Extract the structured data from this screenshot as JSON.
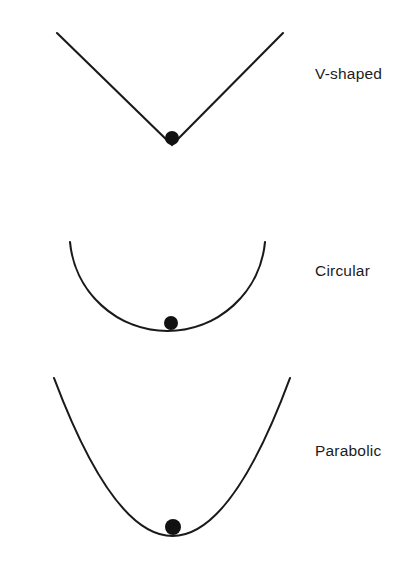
{
  "figure": {
    "background_color": "#ffffff",
    "stroke_color": "#1a1a1a",
    "ball_color": "#111111",
    "width": 420,
    "height": 577
  },
  "wells": [
    {
      "id": "v-shaped",
      "label": "V-shaped",
      "shape_type": "v-shaped",
      "ball_name": "ball-in-v-well"
    },
    {
      "id": "circular",
      "label": "Circular",
      "shape_type": "circular-arc",
      "ball_name": "ball-in-circular-well"
    },
    {
      "id": "parabolic",
      "label": "Parabolic",
      "shape_type": "parabola",
      "ball_name": "ball-in-parabolic-well"
    }
  ],
  "chart_data": {
    "type": "line",
    "title": "",
    "xlabel": "",
    "ylabel": "",
    "grid": false,
    "legend": "right",
    "series": [
      {
        "name": "V-shaped",
        "curve": "v-shaped",
        "vertex": [
          172,
          145
        ],
        "endpoints": [
          [
            57,
            33
          ],
          [
            283,
            33
          ]
        ],
        "ball": {
          "cx": 172,
          "cy": 138,
          "r": 7
        }
      },
      {
        "name": "Circular",
        "curve": "circular-arc",
        "vertex": [
          171,
          331
        ],
        "endpoints": [
          [
            70,
            242
          ],
          [
            265,
            242
          ]
        ],
        "ball": {
          "cx": 171,
          "cy": 323,
          "r": 7
        }
      },
      {
        "name": "Parabolic",
        "curve": "parabola",
        "vertex": [
          173,
          536
        ],
        "endpoints": [
          [
            54,
            378
          ],
          [
            290,
            378
          ]
        ],
        "ball": {
          "cx": 173,
          "cy": 527,
          "r": 8
        }
      }
    ]
  }
}
